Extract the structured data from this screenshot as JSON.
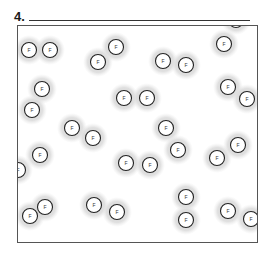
{
  "question": {
    "number": "4.",
    "answer_blank": ""
  },
  "diagram": {
    "atom_label": "F",
    "colors": {
      "cloud": "#d4d4d4",
      "atom_outline": "#222222",
      "box_border": "#555555"
    },
    "atoms": [
      {
        "x": 29,
        "y": 50
      },
      {
        "x": 50,
        "y": 50
      },
      {
        "x": 98,
        "y": 62
      },
      {
        "x": 116,
        "y": 47
      },
      {
        "x": 163,
        "y": 61
      },
      {
        "x": 186,
        "y": 65
      },
      {
        "x": 236,
        "y": 20
      },
      {
        "x": 224,
        "y": 44
      },
      {
        "x": 42,
        "y": 89
      },
      {
        "x": 32,
        "y": 110
      },
      {
        "x": 124,
        "y": 98
      },
      {
        "x": 147,
        "y": 98
      },
      {
        "x": 228,
        "y": 87
      },
      {
        "x": 247,
        "y": 99
      },
      {
        "x": 72,
        "y": 128
      },
      {
        "x": 93,
        "y": 138
      },
      {
        "x": 166,
        "y": 128
      },
      {
        "x": 178,
        "y": 150
      },
      {
        "x": 40,
        "y": 155
      },
      {
        "x": 18,
        "y": 170
      },
      {
        "x": 126,
        "y": 163
      },
      {
        "x": 150,
        "y": 165
      },
      {
        "x": 217,
        "y": 158
      },
      {
        "x": 238,
        "y": 145
      },
      {
        "x": 30,
        "y": 216
      },
      {
        "x": 45,
        "y": 207
      },
      {
        "x": 94,
        "y": 205
      },
      {
        "x": 117,
        "y": 212
      },
      {
        "x": 186,
        "y": 197
      },
      {
        "x": 186,
        "y": 220
      },
      {
        "x": 228,
        "y": 211
      },
      {
        "x": 251,
        "y": 219
      }
    ]
  }
}
